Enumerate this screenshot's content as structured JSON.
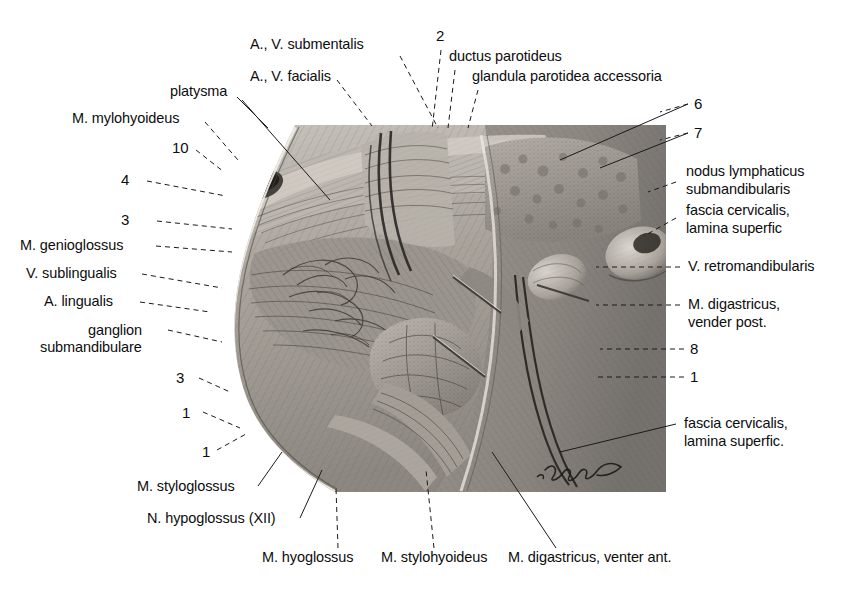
{
  "figure": {
    "kind": "anatomical-engraving",
    "signature": "artist signature (cursive, illegible)",
    "panel": {
      "left": 185,
      "top": 125,
      "right": 666,
      "bottom": 492
    },
    "palette": {
      "ink": "#0d0d0d",
      "paper": "#ffffff",
      "tissue_light": "#cfcac4",
      "tissue_mid": "#a6a09a",
      "tissue_dark": "#6f6a66",
      "tissue_deep": "#48443f",
      "leader": "#1a1a1a"
    }
  },
  "labels": {
    "top": [
      {
        "id": "a-v-submentalis",
        "text": "A., V. submentalis"
      },
      {
        "id": "a-v-facialis",
        "text": "A., V. facialis"
      },
      {
        "id": "platysma",
        "text": "platysma"
      },
      {
        "id": "m-mylohyoideus",
        "text": "M. mylohyoideus"
      },
      {
        "id": "ductus-parotideus",
        "text": "ductus parotideus"
      },
      {
        "id": "glandula-parotidea-accessoria",
        "text": "glandula parotidea accessoria"
      }
    ],
    "left": [
      {
        "id": "m-genioglossus",
        "text": "M. genioglossus"
      },
      {
        "id": "v-sublingualis",
        "text": "V. sublingualis"
      },
      {
        "id": "a-lingualis",
        "text": "A. lingualis"
      },
      {
        "id": "ganglion-submandibulare-1",
        "text": "ganglion"
      },
      {
        "id": "ganglion-submandibulare-2",
        "text": "submandibulare"
      },
      {
        "id": "m-styloglossus",
        "text": "M. styloglossus"
      },
      {
        "id": "n-hypoglossus",
        "text": "N. hypoglossus (XII)"
      }
    ],
    "right": [
      {
        "id": "nodus-lymphaticus-1",
        "text": "nodus lymphaticus"
      },
      {
        "id": "nodus-lymphaticus-2",
        "text": "submandibularis"
      },
      {
        "id": "fascia-cervicalis-upper-1",
        "text": "fascia cervicalis,"
      },
      {
        "id": "fascia-cervicalis-upper-2",
        "text": "lamina superfic"
      },
      {
        "id": "v-retromandibularis",
        "text": "V. retromandibularis"
      },
      {
        "id": "m-digastricus-post-1",
        "text": "M. digastricus,"
      },
      {
        "id": "m-digastricus-post-2",
        "text": "vender post."
      },
      {
        "id": "fascia-cervicalis-lower-1",
        "text": "fascia cervicalis,"
      },
      {
        "id": "fascia-cervicalis-lower-2",
        "text": "lamina superfic."
      }
    ],
    "bottom": [
      {
        "id": "m-hyoglossus",
        "text": "M. hyoglossus"
      },
      {
        "id": "m-stylohyoideus",
        "text": "M. stylohyoideus"
      },
      {
        "id": "m-digastricus-ant",
        "text": "M. digastricus, venter ant."
      }
    ]
  },
  "callouts": [
    {
      "id": "callout-2",
      "text": "2",
      "side": "top"
    },
    {
      "id": "callout-6",
      "text": "6",
      "side": "right"
    },
    {
      "id": "callout-7",
      "text": "7",
      "side": "right"
    },
    {
      "id": "callout-8",
      "text": "8",
      "side": "right"
    },
    {
      "id": "callout-1r",
      "text": "1",
      "side": "right"
    },
    {
      "id": "callout-9",
      "text": "9",
      "side": "left"
    },
    {
      "id": "callout-5",
      "text": "5",
      "side": "left"
    },
    {
      "id": "callout-10",
      "text": "10",
      "side": "left"
    },
    {
      "id": "callout-4",
      "text": "4",
      "side": "left"
    },
    {
      "id": "callout-3",
      "text": "3",
      "side": "left"
    },
    {
      "id": "callout-1l",
      "text": "1",
      "side": "left"
    }
  ]
}
